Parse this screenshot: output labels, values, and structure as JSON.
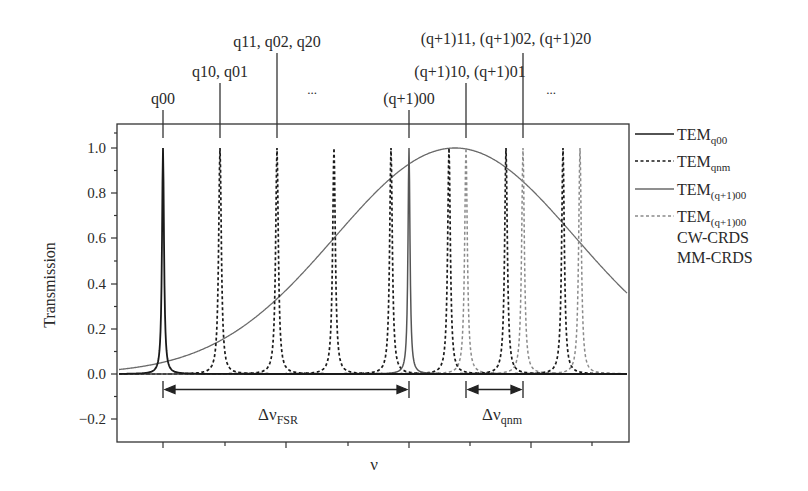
{
  "chart_data": {
    "type": "line",
    "title": "",
    "xlabel": "ν",
    "ylabel": "Transmission",
    "ylim": [
      -0.3,
      1.1
    ],
    "yticks": [
      "1.0",
      "0.8",
      "0.6",
      "0.4",
      "0.2",
      "0.0",
      "-0.2"
    ],
    "ytick_values": [
      1.0,
      0.8,
      0.6,
      0.4,
      0.2,
      0.0,
      -0.2
    ],
    "xticks_labeled": false,
    "grid": false,
    "legend_position": "right-outside",
    "series": [
      {
        "name": "TEM_q00",
        "style": "solid",
        "color": "#1a1a1a",
        "peaks_x_px": [
          163
        ],
        "peak_height": 1.0
      },
      {
        "name": "TEM_qnm",
        "style": "dashed",
        "color": "#1a1a1a",
        "peaks_x_px": [
          220,
          277,
          334,
          391,
          449,
          506,
          563
        ],
        "peak_height": 1.0
      },
      {
        "name": "TEM_(q+1)00",
        "style": "solid",
        "color": "#555555",
        "peaks_x_px": [
          409
        ],
        "peak_height": 1.0
      },
      {
        "name": "TEM_(q+1)00 (gray dashed)",
        "style": "dashed",
        "color": "#8a8a8a",
        "peaks_x_px": [
          466,
          523,
          580
        ],
        "peak_height": 1.0
      },
      {
        "name": "Gaussian envelope",
        "style": "solid",
        "color": "#6a6a6a",
        "center_x_px": 455,
        "peak": 1.0,
        "value_at_right_edge": 0.26
      }
    ],
    "mode_labels": [
      {
        "text": "q00",
        "x": 163
      },
      {
        "text": "q10, q01",
        "x": 220
      },
      {
        "text": "q11, q02, q20",
        "x": 277
      },
      {
        "text": "...",
        "x": 333
      },
      {
        "text": "(q+1)00",
        "x": 409
      },
      {
        "text": "(q+1)10, (q+1)01",
        "x": 466
      },
      {
        "text": "(q+1)11, (q+1)02, (q+1)20",
        "x": 523
      },
      {
        "text": "...",
        "x": 551
      }
    ],
    "annotations": [
      {
        "text": "Δν",
        "sub": "FSR",
        "from_x": 163,
        "to_x": 409
      },
      {
        "text": "Δν",
        "sub": "qnm",
        "from_x": 466,
        "to_x": 523
      }
    ]
  },
  "legend": [
    {
      "main": "TEM",
      "sub": "q00",
      "style": "solid",
      "color": "#1a1a1a"
    },
    {
      "main": "TEM",
      "sub": "qnm",
      "style": "dashed",
      "color": "#1a1a1a"
    },
    {
      "main": "TEM",
      "sub": "(q+1)00",
      "style": "solid",
      "color": "#6a6a6a"
    },
    {
      "main": "TEM",
      "sub": "(q+1)00",
      "style": "dashed",
      "color": "#8a8a8a"
    },
    {
      "main": "CW-CRDS",
      "sub": "",
      "style": "none",
      "color": ""
    },
    {
      "main": "MM-CRDS",
      "sub": "",
      "style": "none",
      "color": ""
    }
  ],
  "labels": {
    "ylabel": "Transmission",
    "xlabel": "ν",
    "fsr_main": "Δν",
    "fsr_sub": "FSR",
    "qnm_main": "Δν",
    "qnm_sub": "qnm",
    "lbl_q00": "q00",
    "lbl_q10": "q10, q01",
    "lbl_q11": "q11, q02, q20",
    "lbl_dots1": "...",
    "lbl_q100": "(q+1)00",
    "lbl_q110": "(q+1)10, (q+1)01",
    "lbl_q111": "(q+1)11, (q+1)02, (q+1)20",
    "lbl_dots2": "...",
    "yt0": "1.0",
    "yt1": "0.8",
    "yt2": "0.6",
    "yt3": "0.4",
    "yt4": "0.2",
    "yt5": "0.0",
    "yt6": "−0.2",
    "leg0_main": "TEM",
    "leg0_sub": "q00",
    "leg1_main": "TEM",
    "leg1_sub": "qnm",
    "leg2_main": "TEM",
    "leg2_sub": "(q+1)00",
    "leg3_main": "TEM",
    "leg3_sub": "(q+1)00",
    "leg4": "CW-CRDS",
    "leg5": "MM-CRDS"
  }
}
